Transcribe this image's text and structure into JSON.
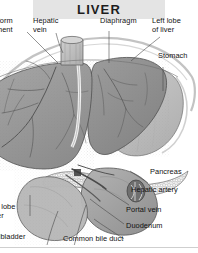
{
  "figure": {
    "title": "LIVER",
    "title_bg": "#e4e4e4",
    "background": "#ffffff",
    "width": 198,
    "height": 253
  },
  "palette": {
    "liver_right_lobe": "#9a9a9a",
    "liver_left_lobe": "#8e8e8e",
    "stomach": "#c0c0c0",
    "duodenum": "#a8a8a8",
    "pancreas": "#e8e8e8",
    "gallbladder": "#b5b5b5",
    "vena_cava": "#bdbdbd",
    "vessel_line": "#5c5c5c",
    "outline": "#3a3a3a",
    "leader_line": "#4a4a4a",
    "label_text": "#111111",
    "bottom_rule": "#cfcfcf"
  },
  "labels": [
    {
      "id": "falciform-ligament",
      "lines": "iform\nment",
      "full": "Falciform ligament",
      "clipped": true,
      "x": -4,
      "y": 17
    },
    {
      "id": "hepatic-vein",
      "lines": "Hepatic\nvein",
      "full": "Hepatic vein",
      "clipped": false,
      "x": 33,
      "y": 17
    },
    {
      "id": "diaphragm",
      "lines": "Diaphragm",
      "full": "Diaphragm",
      "clipped": false,
      "x": 100,
      "y": 17
    },
    {
      "id": "left-lobe-of-liver",
      "lines": "Left lobe\nof liver",
      "full": "Left lobe of liver",
      "clipped": false,
      "x": 152,
      "y": 17
    },
    {
      "id": "stomach",
      "lines": "Stomach",
      "full": "Stomach",
      "clipped": false,
      "x": 158,
      "y": 52
    },
    {
      "id": "pancreas",
      "lines": "Pancreas",
      "full": "Pancreas",
      "clipped": false,
      "x": 150,
      "y": 168
    },
    {
      "id": "hepatic-artery",
      "lines": "Hepatic artery",
      "full": "Hepatic artery",
      "clipped": false,
      "x": 131,
      "y": 186
    },
    {
      "id": "portal-vein",
      "lines": "Portal vein",
      "full": "Portal vein",
      "clipped": false,
      "x": 126,
      "y": 206
    },
    {
      "id": "duodenum",
      "lines": "Duodenum",
      "full": "Duodenum",
      "clipped": false,
      "x": 126,
      "y": 222
    },
    {
      "id": "right-lobe-of-liver",
      "lines": "t lobe\ner",
      "full": "Right lobe of liver",
      "clipped": true,
      "x": -3,
      "y": 203
    },
    {
      "id": "gallbladder",
      "lines": "llbladder",
      "full": "Gallbladder",
      "clipped": true,
      "x": -3,
      "y": 233
    },
    {
      "id": "common-bile-duct",
      "lines": "Common bile duct",
      "full": "Common bile duct",
      "clipped": false,
      "x": 63,
      "y": 235
    }
  ]
}
